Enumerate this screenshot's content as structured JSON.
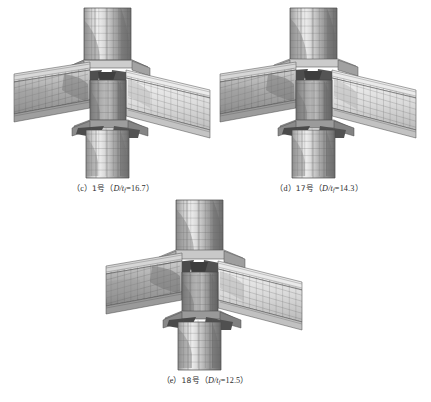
{
  "figure": {
    "background_color": "#ffffff",
    "width": 431,
    "height": 402,
    "render_style": "grayscale finite-element mesh",
    "palette": {
      "mesh_line": "#4a4a4a",
      "surface_light": "#e2e2e2",
      "surface_mid": "#b9b9b9",
      "surface_dark": "#8a8a8a",
      "surface_darkest": "#5a5a5a",
      "caption_text": "#2b2b2b"
    }
  },
  "panels": [
    {
      "id": "c",
      "label_index": "（c）",
      "specimen": "1号",
      "param_symbol": "D/t",
      "param_subscript": "f",
      "param_equals": "=",
      "param_value": "16.7",
      "caption_open_paren": "（",
      "caption_close_paren": "）",
      "caption_full": "（c）1号（D/tf=16.7）",
      "column_ratio": 16.7
    },
    {
      "id": "d",
      "label_index": "（d）",
      "specimen": "17号",
      "param_symbol": "D/t",
      "param_subscript": "f",
      "param_equals": "=",
      "param_value": "14.3",
      "caption_open_paren": "（",
      "caption_close_paren": "）",
      "caption_full": "（d）17号（D/tf=14.3）",
      "column_ratio": 14.3
    },
    {
      "id": "e",
      "label_index": "（e）",
      "specimen": "18号",
      "param_symbol": "D/t",
      "param_subscript": "f",
      "param_equals": "=",
      "param_value": "12.5",
      "caption_open_paren": "（",
      "caption_close_paren": "）",
      "caption_full": "（e）18号（D/tf=12.5）",
      "column_ratio": 12.5
    }
  ]
}
